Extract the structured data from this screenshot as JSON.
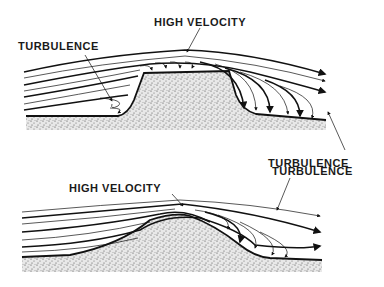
{
  "diagram": {
    "top_panel": {
      "labels": {
        "high_velocity": "HIGH VELOCITY",
        "turbulence_left": "TURBULENCE",
        "turbulence_right": "TURBULENCE"
      },
      "obstacle": "flat-topped ridge"
    },
    "bottom_panel": {
      "labels": {
        "high_velocity": "HIGH VELOCITY",
        "turbulence": "TURBULENCE"
      },
      "obstacle": "rounded hill"
    },
    "colors": {
      "ink": "#111111",
      "background": "#ffffff",
      "stipple": "#555555"
    }
  }
}
